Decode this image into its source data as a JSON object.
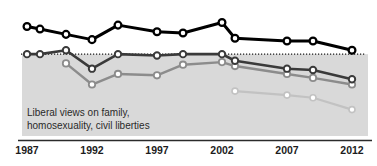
{
  "chart_data": {
    "type": "line",
    "title": "",
    "subtitle": "",
    "xlabel": "",
    "ylabel": "",
    "grid": false,
    "legend_position": "none",
    "xlim": [
      1987,
      2012
    ],
    "ylim": [
      0,
      100
    ],
    "tick_labels": [
      "1987",
      "1992",
      "1997",
      "2002",
      "2007",
      "2012"
    ],
    "ticks": [
      1987,
      1992,
      1997,
      2002,
      2007,
      2012
    ],
    "annotations": [
      {
        "name": "band-annotation",
        "line1": "Liberal views on family,",
        "line2": "homosexuality, civil liberties"
      }
    ],
    "reference_line": {
      "name": "dotted-baseline",
      "style": "dotted",
      "y": 62,
      "x_start": 1987,
      "x_end": 2012
    },
    "shaded_band": {
      "name": "liberal-views-band",
      "color": "#d9d9d9",
      "y_top": 62,
      "y_bottom": 0
    },
    "series": [
      {
        "name": "series-1",
        "color": "#000000",
        "x": [
          1987,
          1988,
          1990,
          1992,
          1994,
          1997,
          1999,
          2002,
          2003,
          2007,
          2009,
          2012
        ],
        "values": [
          83,
          81,
          77,
          73,
          84,
          79,
          78,
          86,
          74,
          72,
          72,
          65
        ]
      },
      {
        "name": "series-2",
        "color": "#3a3a3a",
        "x": [
          1987,
          1988,
          1990,
          1992,
          1994,
          1997,
          1999,
          2002,
          2003,
          2007,
          2009,
          2012
        ],
        "values": [
          62,
          62,
          65,
          51,
          62,
          61,
          62,
          62,
          57,
          51,
          50,
          43
        ]
      },
      {
        "name": "series-3",
        "color": "#8c8c8c",
        "x": [
          1990,
          1992,
          1994,
          1997,
          1999,
          2002,
          2003,
          2007,
          2009,
          2012
        ],
        "values": [
          55,
          39,
          47,
          46,
          54,
          56,
          53,
          47,
          44,
          39
        ]
      },
      {
        "name": "series-4",
        "color": "#c2c2c2",
        "x": [
          2003,
          2007,
          2009,
          2012
        ],
        "values": [
          34,
          31,
          29,
          20
        ]
      }
    ]
  },
  "axis": {
    "name": "x-axis",
    "labels": [
      "1987",
      "1992",
      "1997",
      "2002",
      "2007",
      "2012"
    ]
  }
}
